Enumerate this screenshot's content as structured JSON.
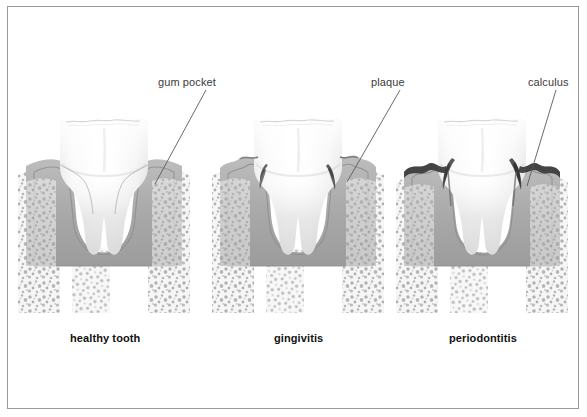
{
  "figure": {
    "background_color": "#ffffff",
    "frame_color": "#9a9a9a",
    "label_color": "#3b3b3b",
    "caption_color": "#111111",
    "leader_color": "#5a5a5a"
  },
  "callouts": [
    {
      "id": "gum-pocket",
      "label": "gum pocket",
      "target_panel": "healthy tooth"
    },
    {
      "id": "plaque",
      "label": "plaque",
      "target_panel": "gingivitis"
    },
    {
      "id": "calculus",
      "label": "calculus",
      "target_panel": "periodontitis"
    }
  ],
  "panels": [
    {
      "id": "healthy",
      "caption": "healthy tooth"
    },
    {
      "id": "gingivitis",
      "caption": "gingivitis"
    },
    {
      "id": "periodontitis",
      "caption": "periodontitis"
    }
  ],
  "anatomy": {
    "enamel_color": "#fbfbfb",
    "dentin_shadow": "#dcdcdc",
    "gum_color": "#b0b0b0",
    "gum_inner": "#9a9a9a",
    "bone_color": "#f2f2f2",
    "bone_speckle": "#9c9c9c",
    "deposit_color": "#4a4a4a"
  }
}
